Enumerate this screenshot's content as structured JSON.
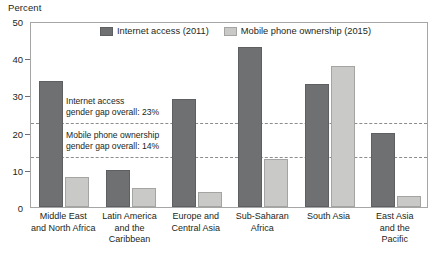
{
  "chart_data": {
    "type": "bar",
    "title": "",
    "ylabel": "Percent",
    "xlabel": "",
    "ylim": [
      0,
      50
    ],
    "yticks": [
      0,
      10,
      20,
      30,
      40,
      50
    ],
    "grid": false,
    "legend_position": "top-center",
    "categories": [
      "Middle East and North Africa",
      "Latin America and the Caribbean",
      "Europe and Central Asia",
      "Sub-Saharan Africa",
      "South Asia",
      "East Asia and the Pacific"
    ],
    "category_lines": [
      [
        "Middle East",
        "and North Africa"
      ],
      [
        "Latin America",
        "and the",
        "Caribbean"
      ],
      [
        "Europe and",
        "Central Asia"
      ],
      [
        "Sub-Saharan",
        "Africa"
      ],
      [
        "South Asia"
      ],
      [
        "East Asia",
        "and the",
        "Pacific"
      ]
    ],
    "series": [
      {
        "name": "Internet access (2011)",
        "color": "#6e7072",
        "values": [
          34,
          10,
          29,
          43,
          33,
          20
        ]
      },
      {
        "name": "Mobile phone ownership (2015)",
        "color": "#c9cac7",
        "values": [
          8,
          5,
          4,
          13,
          38,
          3
        ]
      }
    ],
    "reference_lines": [
      {
        "name": "internet-access-gap",
        "value": 23,
        "label_lines": [
          "Internet access",
          "gender gap overall: 23%"
        ],
        "style": "dashed"
      },
      {
        "name": "mobile-phone-gap",
        "value": 14,
        "label_lines": [
          "Mobile phone ownership",
          "gender gap overall: 14%"
        ],
        "style": "dashed"
      }
    ]
  }
}
